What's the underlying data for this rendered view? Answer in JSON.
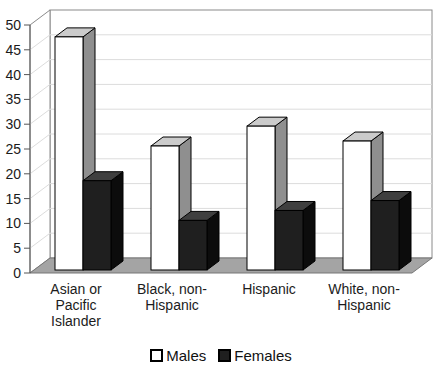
{
  "chart_data": {
    "type": "bar",
    "style": "3d-clustered-column",
    "title": "",
    "xlabel": "",
    "ylabel": "",
    "categories": [
      "Asian or Pacific Islander",
      "Black, non-Hispanic",
      "Hispanic",
      "White, non-Hispanic"
    ],
    "category_lines": [
      [
        "Asian or",
        "Pacific",
        "Islander"
      ],
      [
        "Black, non-",
        "Hispanic"
      ],
      [
        "Hispanic"
      ],
      [
        "White, non-",
        "Hispanic"
      ]
    ],
    "series": [
      {
        "name": "Males",
        "values": [
          47,
          25,
          29,
          26
        ],
        "fill": "#ffffff",
        "top": "#cbcbcb",
        "side": "#8f8f8f",
        "stroke": "#000000"
      },
      {
        "name": "Females",
        "values": [
          18,
          10,
          12,
          14
        ],
        "fill": "#1f1f1f",
        "top": "#3f3f3f",
        "side": "#0c0c0c",
        "stroke": "#000000"
      }
    ],
    "ylim": [
      0,
      50
    ],
    "ytick_step": 5,
    "y_ticks": [
      0,
      5,
      10,
      15,
      20,
      25,
      30,
      35,
      40,
      45,
      50
    ],
    "grid": true,
    "legend_position": "bottom",
    "colors": {
      "floor": "#a4a4a4",
      "floor_stroke": "#777777",
      "wall_fill": "#ffffff",
      "wall_stroke": "#8a8a8a",
      "gridline": "#dcdcdc",
      "axis": "#555555",
      "text": "#1a1a1a"
    }
  }
}
